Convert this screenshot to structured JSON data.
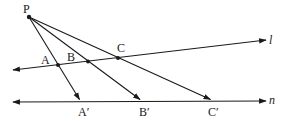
{
  "diagram": {
    "colors": {
      "stroke": "#1a1a1a",
      "background": "#ffffff"
    },
    "center": {
      "label": "P",
      "x": 29,
      "y": 17
    },
    "lines": [
      {
        "name": "l",
        "label": "l",
        "x1": 13,
        "y1": 70,
        "x2": 266,
        "y2": 40,
        "arrows": "both"
      },
      {
        "name": "n",
        "label": "n",
        "x1": 13,
        "y1": 102,
        "x2": 266,
        "y2": 101,
        "arrows": "both"
      }
    ],
    "points_on_l": [
      {
        "label": "A",
        "x": 58,
        "y": 65
      },
      {
        "label": "B",
        "x": 88,
        "y": 61
      },
      {
        "label": "C",
        "x": 118,
        "y": 58
      }
    ],
    "points_on_n": [
      {
        "label": "A′",
        "x": 80,
        "y": 101
      },
      {
        "label": "B′",
        "x": 141,
        "y": 101
      },
      {
        "label": "C′",
        "x": 212,
        "y": 101
      }
    ],
    "rays": [
      {
        "from": "P",
        "through": "A",
        "to": "A′"
      },
      {
        "from": "P",
        "through": "B",
        "to": "B′"
      },
      {
        "from": "P",
        "through": "C",
        "to": "C′"
      }
    ],
    "labels": {
      "P": "P",
      "A": "A",
      "B": "B",
      "C": "C",
      "A_prime": "A′",
      "B_prime": "B′",
      "C_prime": "C′",
      "l": "l",
      "n": "n"
    }
  }
}
